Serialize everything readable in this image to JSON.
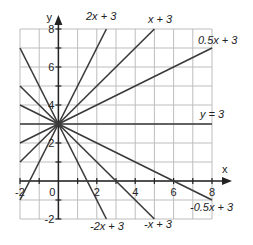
{
  "chart_data": {
    "type": "line",
    "title": "",
    "xlabel": "x",
    "ylabel": "y",
    "xlim": [
      -2,
      8
    ],
    "ylim": [
      -2,
      8
    ],
    "grid": true,
    "x_tick_labels": [
      "-2",
      "0",
      "2",
      "4",
      "6",
      "8"
    ],
    "y_tick_labels": [
      "-2",
      "2",
      "4",
      "6",
      "8"
    ],
    "common_point": [
      0,
      3
    ],
    "series": [
      {
        "name": "2x + 3",
        "slope": 2,
        "intercept": 3,
        "label": "2x + 3"
      },
      {
        "name": "x + 3",
        "slope": 1,
        "intercept": 3,
        "label": "x + 3"
      },
      {
        "name": "0.5x + 3",
        "slope": 0.5,
        "intercept": 3,
        "label": "0.5x + 3"
      },
      {
        "name": "y = 3",
        "slope": 0,
        "intercept": 3,
        "label": "y = 3"
      },
      {
        "name": "-0.5x + 3",
        "slope": -0.5,
        "intercept": 3,
        "label": "-0.5x + 3"
      },
      {
        "name": "-x + 3",
        "slope": -1,
        "intercept": 3,
        "label": "-x + 3"
      },
      {
        "name": "-2x + 3",
        "slope": -2,
        "intercept": 3,
        "label": "-2x + 3"
      }
    ]
  },
  "axes": {
    "x_label": "x",
    "y_label": "y",
    "origin_label": "0"
  },
  "line_color": "#3a3a3a",
  "grid_color": "#bdbdbd"
}
